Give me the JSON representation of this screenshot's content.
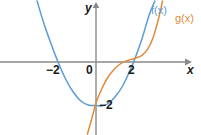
{
  "figure": {
    "width": 201,
    "height": 135,
    "background": "#ffffff"
  },
  "axes": {
    "x_name": "x",
    "y_name": "y",
    "origin_label": "0",
    "axis_color": "#8a8a8a",
    "x_ticks": [
      {
        "value": -2,
        "label": "−2"
      },
      {
        "value": 2,
        "label": "2"
      }
    ],
    "y_ticks": [
      {
        "value": -2,
        "label": "−2"
      }
    ],
    "xlim": [
      -5.05,
      5.5
    ],
    "ylim": [
      -3.65,
      3.1
    ]
  },
  "series": [
    {
      "key": "f",
      "label": "f(x)",
      "color": "#5b9bd5",
      "type": "parabola"
    },
    {
      "key": "g",
      "label": "g(x)",
      "color": "#e08b3c",
      "type": "cubic"
    }
  ],
  "chart_data": {
    "type": "line",
    "title": "",
    "xlabel": "x",
    "ylabel": "y",
    "xlim": [
      -5.05,
      5.5
    ],
    "ylim": [
      -3.65,
      3.1
    ],
    "grid": false,
    "legend_position": "top-right-inline",
    "xticks": [
      -2,
      2
    ],
    "xticklabels": [
      "−2",
      "2"
    ],
    "yticks": [
      -2
    ],
    "yticklabels": [
      "−2"
    ],
    "annotations": [
      "0"
    ],
    "series": [
      {
        "name": "f(x)",
        "color": "#5b9bd5",
        "shape": "upward parabola, roots near x = -2 and x = 2, vertex near (0.3, -2.2)",
        "x": [
          -3.1,
          -2.75,
          -2.4,
          -2.0,
          -1.6,
          -1.2,
          -0.8,
          -0.4,
          0.0,
          0.3,
          0.6,
          1.0,
          1.4,
          1.8,
          2.0,
          2.4,
          2.8,
          3.1
        ],
        "y": [
          3.05,
          1.95,
          1.0,
          0.0,
          -0.85,
          -1.5,
          -1.95,
          -2.15,
          -2.18,
          -2.2,
          -2.1,
          -1.75,
          -1.2,
          -0.4,
          0.05,
          1.1,
          2.35,
          3.05
        ]
      },
      {
        "name": "g(x)",
        "color": "#e08b3c",
        "shape": "increasing cubic-like curve through (0, -2), flattening near x = 1.5, rising steeply after x = 2.5",
        "x": [
          -0.45,
          -0.2,
          0.0,
          0.3,
          0.6,
          0.9,
          1.2,
          1.5,
          1.8,
          2.1,
          2.4,
          2.7,
          3.0,
          3.3,
          3.5
        ],
        "y": [
          -3.6,
          -2.75,
          -2.05,
          -1.35,
          -0.8,
          -0.42,
          -0.15,
          0.02,
          0.12,
          0.2,
          0.32,
          0.62,
          1.2,
          2.2,
          3.05
        ]
      }
    ]
  },
  "labels": {
    "fx": "f(x)",
    "gx": "g(x)",
    "x_axis": "x",
    "y_axis": "y",
    "origin": "0",
    "x_tick_neg2": "−2",
    "x_tick_pos2": "2",
    "y_tick_neg2": "−2"
  }
}
